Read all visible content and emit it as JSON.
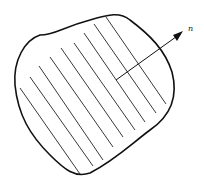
{
  "figure": {
    "normal_label": "n",
    "hatch_count": 9,
    "colors": {
      "stroke": "#111111",
      "background": "#ffffff"
    }
  }
}
